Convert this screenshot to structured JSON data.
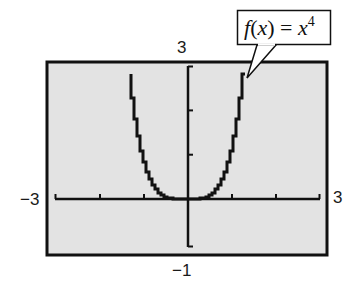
{
  "chart_data": {
    "type": "line",
    "title": "",
    "function_label": {
      "prefix": "f",
      "open": "(",
      "var": "x",
      "close": ")",
      "equals": " = ",
      "base": "x",
      "exponent": "4"
    },
    "series": [
      {
        "name": "f(x) = x^4",
        "expression": "x^4",
        "x": [
          -1.32,
          -1.25,
          -1.0,
          -0.75,
          -0.5,
          -0.25,
          0,
          0.25,
          0.5,
          0.75,
          1.0,
          1.25,
          1.32
        ],
        "y": [
          3.0,
          2.44,
          1.0,
          0.32,
          0.06,
          0.0,
          0,
          0.0,
          0.06,
          0.32,
          1.0,
          2.44,
          3.0
        ]
      }
    ],
    "xlim": [
      -3,
      3
    ],
    "ylim": [
      -1,
      3
    ],
    "xscale_ticks": 1,
    "yscale_ticks": 1,
    "window_labels": {
      "xmin": "−3",
      "xmax": "3",
      "ymin": "−1",
      "ymax": "3"
    },
    "grid": false,
    "legend": "callout",
    "xlabel": "",
    "ylabel": ""
  },
  "colors": {
    "screen_bg": "#e3e3e3",
    "frame": "#111111",
    "curve": "#111111",
    "page_bg": "#ffffff"
  }
}
